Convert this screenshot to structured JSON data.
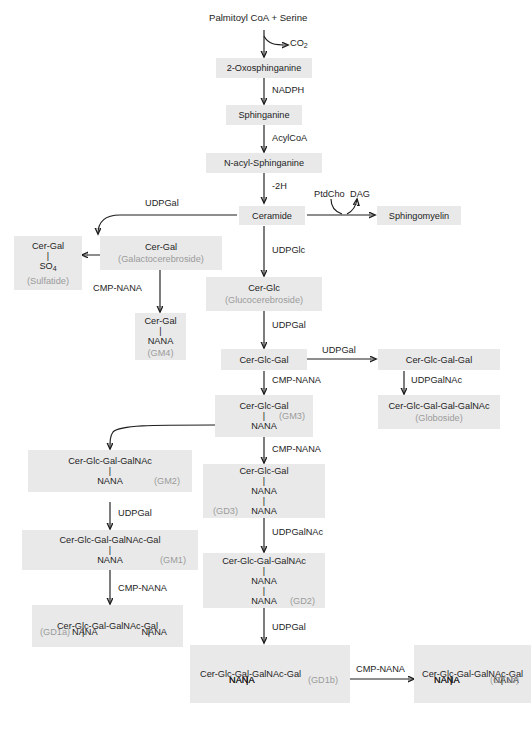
{
  "diagram": {
    "box_fill": "#e9e9e9",
    "text_color": "#1d1d1d",
    "muted_color": "#9b9b9b",
    "arrow_color": "#1d1d1d"
  },
  "nodes": {
    "palmitoyl": {
      "line1": "Palmitoyl CoA + Serine"
    },
    "oxosphinganine": {
      "line1": "2-Oxosphinganine"
    },
    "sphinganine": {
      "line1": "Sphinganine"
    },
    "nacyl_sphinganine": {
      "line1": "N-acyl-Sphinganine"
    },
    "ceramide": {
      "line1": "Ceramide"
    },
    "sphingomyelin": {
      "line1": "Sphingomyelin"
    },
    "cer_gal": {
      "line1": "Cer-Gal",
      "line2": "(Galactocerebroside)"
    },
    "sulfatide": {
      "line1": "Cer-Gal",
      "line2": "SO",
      "sub2": "4",
      "line3": "(Sulfatide)"
    },
    "gm4": {
      "line1": "Cer-Gal",
      "line2": "NANA",
      "tag": "(GM4)"
    },
    "cer_glc": {
      "line1": "Cer-Glc",
      "line2": "(Glucocerebroside)"
    },
    "cer_glc_gal": {
      "line1": "Cer-Glc-Gal"
    },
    "cer_glc_gal_gal": {
      "line1": "Cer-Glc-Gal-Gal"
    },
    "globoside": {
      "line1": "Cer-Glc-Gal-Gal-GalNAc",
      "line2": "(Globoside)"
    },
    "gm3": {
      "line1": "Cer-Glc-Gal",
      "line2": "NANA",
      "tag": "(GM3)"
    },
    "gd3": {
      "line1": "Cer-Glc-Gal",
      "line2": "NANA",
      "line3": "NANA",
      "tag": "(GD3)"
    },
    "gm2": {
      "line1": "Cer-Glc-Gal-GalNAc",
      "line2": "NANA",
      "tag": "(GM2)"
    },
    "gd2": {
      "line1": "Cer-Glc-Gal-GalNAc",
      "line2": "NANA",
      "line3": "NANA",
      "tag": "(GD2)"
    },
    "gm1": {
      "line1": "Cer-Glc-Gal-GalNAc-Gal",
      "line2": "NANA",
      "tag": "(GM1)"
    },
    "gd1b": {
      "line1": "Cer-Glc-Gal-GalNAc-Gal",
      "line2": "NANA",
      "line3": "NANA",
      "tag": "(GD1b)"
    },
    "gd1a": {
      "line1": "Cer-Glc-Gal-GalNAc-Gal",
      "line2a": "NANA",
      "line2b": "NANA",
      "tag": "(GD1a)"
    },
    "gt1b": {
      "line1": "Cer-Glc-Gal-GalNAc-Gal",
      "line2a": "NANA",
      "line2b": "NANA",
      "line3": "NANA",
      "tag": "(GT1b)"
    }
  },
  "labels": {
    "co2": "CO",
    "co2_sub": "2",
    "nadph": "NADPH",
    "acylcoa": "AcylCoA",
    "minus2h": "-2H",
    "ptdcho": "PtdCho",
    "dag": "DAG",
    "udpgal_ceramide": "UDPGal",
    "udpglc": "UDPGlc",
    "cmpnana_sulfatide": "CMP-NANA",
    "udpgal_cerglc": "UDPGal",
    "udpgal_globo": "UDPGal",
    "udpgalnac_globo": "UDPGalNAc",
    "cmpnana_gm3": "CMP-NANA",
    "cmpnana_gd3": "CMP-NANA",
    "udpgalnac_gm2": "UDPGalNAc",
    "udpgal_gm1": "UDPGal",
    "cmpnana_gd1a": "CMP-NANA",
    "udpgalnac_gd2": "UDPGalNAc",
    "udpgal_gd1b": "UDPGal",
    "cmpnana_gt1b": "CMP-NANA"
  }
}
